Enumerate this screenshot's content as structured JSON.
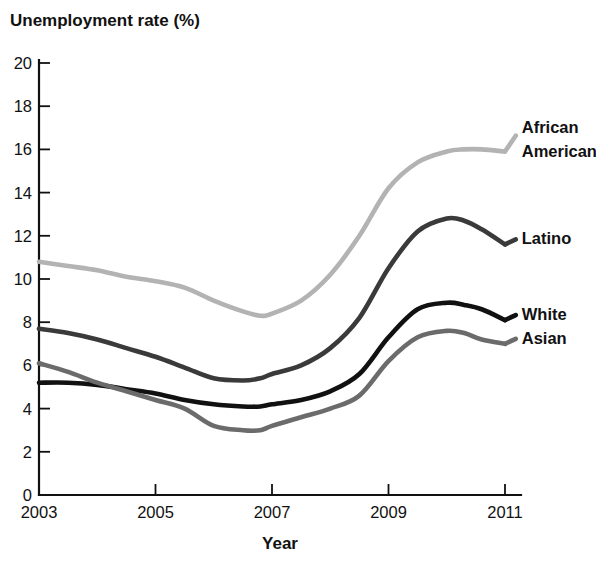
{
  "chart_data": {
    "type": "line",
    "title": "Unemployment rate (%)",
    "xlabel": "Year",
    "ylabel": "Unemployment rate (%)",
    "xlim": [
      2003,
      2011
    ],
    "ylim": [
      0,
      20
    ],
    "grid": false,
    "legend_position": "right-inline-labels",
    "xticks": [
      2003,
      2005,
      2007,
      2009,
      2011
    ],
    "xtick_labels": [
      "2003",
      "2005",
      "2007",
      "2009",
      "2011"
    ],
    "yticks": [
      0,
      2,
      4,
      6,
      8,
      10,
      12,
      14,
      16,
      18,
      20
    ],
    "ytick_labels": [
      "0",
      "2",
      "4",
      "6",
      "8",
      "10",
      "12",
      "14",
      "16",
      "18",
      "20"
    ],
    "x": [
      2003,
      2003.5,
      2004,
      2004.5,
      2005,
      2005.5,
      2006,
      2006.5,
      2006.8,
      2007,
      2007.5,
      2008,
      2008.5,
      2009,
      2009.5,
      2010,
      2010.3,
      2010.6,
      2011
    ],
    "series": [
      {
        "name": "African American",
        "color": "#b3b3b3",
        "label_x": 2011.15,
        "label_y": 16.4,
        "values": [
          10.8,
          10.6,
          10.4,
          10.1,
          9.9,
          9.6,
          9.0,
          8.5,
          8.3,
          8.4,
          9.0,
          10.2,
          12.0,
          14.2,
          15.4,
          15.9,
          16.0,
          16.0,
          15.9
        ]
      },
      {
        "name": "Latino",
        "color": "#3a3a3a",
        "label_x": 2011.15,
        "label_y": 11.6,
        "values": [
          7.7,
          7.5,
          7.2,
          6.8,
          6.4,
          5.9,
          5.4,
          5.3,
          5.4,
          5.6,
          6.0,
          6.8,
          8.2,
          10.5,
          12.2,
          12.8,
          12.7,
          12.3,
          11.6
        ]
      },
      {
        "name": "White",
        "color": "#111111",
        "label_x": 2011.15,
        "label_y": 8.1,
        "values": [
          5.2,
          5.2,
          5.1,
          4.9,
          4.7,
          4.4,
          4.2,
          4.1,
          4.1,
          4.2,
          4.4,
          4.8,
          5.6,
          7.3,
          8.6,
          8.9,
          8.8,
          8.6,
          8.1
        ]
      },
      {
        "name": "Asian",
        "color": "#6b6b6b",
        "label_x": 2011.15,
        "label_y": 7.0,
        "values": [
          6.1,
          5.7,
          5.2,
          4.8,
          4.4,
          4.0,
          3.2,
          3.0,
          3.0,
          3.2,
          3.6,
          4.0,
          4.6,
          6.2,
          7.3,
          7.6,
          7.5,
          7.2,
          7.0
        ]
      }
    ]
  },
  "legend_labels": {
    "african_american_line1": "African",
    "african_american_line2": "American",
    "latino": "Latino",
    "white": "White",
    "asian": "Asian"
  }
}
